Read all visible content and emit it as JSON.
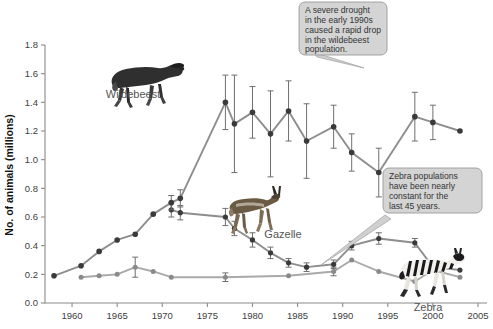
{
  "figure": {
    "title": "",
    "y_axis_title": "No. of animals (millions)",
    "x_axis_title": "",
    "y_ticks": [
      "0.0",
      "0.2",
      "0.4",
      "0.6",
      "0.8",
      "1.0",
      "1.2",
      "1.4",
      "1.6",
      "1.8"
    ],
    "x_ticks": [
      "1960",
      "1965",
      "1970",
      "1975",
      "1980",
      "1985",
      "1990",
      "1995",
      "2000",
      "2005"
    ],
    "series_labels": {
      "wildebeest": "Wildebeest",
      "gazelle": "Gazelle",
      "zebra": "Zebra"
    },
    "callouts": {
      "drought": {
        "lines": [
          "A severe drought",
          "in the early 1990s",
          "caused a rapid drop",
          "in the wildebeest",
          "population."
        ]
      },
      "zebra_constant": {
        "lines": [
          "Zebra populations",
          "have been nearly",
          "constant for the",
          "last 45 years."
        ]
      }
    },
    "colors": {
      "line": "#8d8d8d",
      "line_light": "#a9a9a9",
      "marker": "#3a3a3a",
      "marker_light": "#8a8a8a",
      "axis": "#8a8a8a",
      "callout_fill": "#d4d4d4",
      "callout_stroke": "#9a9a9a",
      "tick_label": "#3d3d3d",
      "series_label": "#555555"
    }
  },
  "chart_data": {
    "type": "line",
    "xlabel": "",
    "ylabel": "No. of animals (millions)",
    "xlim": [
      1957,
      2006
    ],
    "ylim": [
      0.0,
      1.8
    ],
    "ytick_step": 0.2,
    "xtick_step": 5,
    "grid": false,
    "legend": "inline-labels-with-animal-images",
    "series": [
      {
        "name": "Wildebeest",
        "x": [
          1958,
          1961,
          1963,
          1965,
          1967,
          1969,
          1971,
          1972,
          1977,
          1978,
          1980,
          1982,
          1984,
          1986,
          1989,
          1991,
          1994,
          1998,
          2000,
          2003
        ],
        "values": [
          0.19,
          0.26,
          0.36,
          0.44,
          0.48,
          0.62,
          0.7,
          0.73,
          1.4,
          1.25,
          1.33,
          1.18,
          1.34,
          1.13,
          1.23,
          1.05,
          0.91,
          1.3,
          1.26,
          1.2
        ],
        "errors": [
          0.0,
          0.0,
          0.0,
          0.0,
          0.0,
          0.0,
          0.05,
          0.06,
          0.19,
          0.34,
          0.18,
          0.3,
          0.21,
          0.26,
          0.15,
          0.13,
          0.17,
          0.17,
          0.12,
          0.0
        ]
      },
      {
        "name": "Gazelle",
        "x": [
          1971,
          1972,
          1977,
          1978,
          1980,
          1982,
          1984,
          1986,
          1989,
          1991,
          1994,
          1998,
          2000,
          2003
        ],
        "values": [
          0.65,
          0.63,
          0.6,
          0.52,
          0.44,
          0.35,
          0.28,
          0.25,
          0.27,
          0.4,
          0.45,
          0.42,
          0.25,
          0.23
        ],
        "errors": [
          0.05,
          0.05,
          0.06,
          0.05,
          0.05,
          0.04,
          0.03,
          0.03,
          0.03,
          0.03,
          0.04,
          0.03,
          0.0,
          0.0
        ]
      },
      {
        "name": "Zebra",
        "x": [
          1961,
          1963,
          1965,
          1967,
          1969,
          1971,
          1977,
          1984,
          1989,
          1991,
          1994,
          1998,
          2000,
          2003
        ],
        "values": [
          0.18,
          0.19,
          0.2,
          0.25,
          0.22,
          0.18,
          0.18,
          0.19,
          0.22,
          0.3,
          0.22,
          0.15,
          0.23,
          0.18
        ],
        "errors": [
          0.0,
          0.0,
          0.0,
          0.07,
          0.0,
          0.0,
          0.03,
          0.0,
          0.03,
          0.0,
          0.0,
          0.0,
          0.0,
          0.0
        ]
      }
    ],
    "annotations": [
      {
        "text": "A severe drought in the early 1990s caused a rapid drop in the wildebeest population.",
        "points_to_series": "Wildebeest",
        "points_to_x": 1994,
        "points_to_y": 0.91
      },
      {
        "text": "Zebra populations have been nearly constant for the last 45 years.",
        "points_to_series": "Zebra",
        "points_to_x": 1994,
        "points_to_y": 0.22
      }
    ]
  }
}
